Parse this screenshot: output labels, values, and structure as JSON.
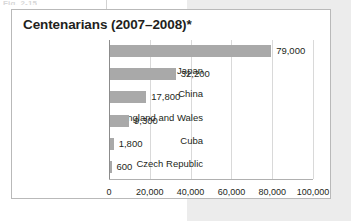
{
  "page": {
    "background_color": "#ffffff",
    "panel_color": "#ececec",
    "truncated_caption": "Fig. 2-15"
  },
  "figure": {
    "title": "Centenarians (2007–2008)*",
    "border_color": "#b9b9b9",
    "background_color": "#ffffff"
  },
  "chart_data": {
    "type": "bar",
    "orientation": "horizontal",
    "title": "Centenarians (2007–2008)*",
    "xlabel": "",
    "ylabel": "",
    "categories": [
      "U.S.",
      "Japan",
      "China",
      "England and Wales",
      "Cuba",
      "Czech Republic"
    ],
    "values": [
      79000,
      32200,
      17800,
      9300,
      1800,
      600
    ],
    "value_labels": [
      "79,000",
      "32,200",
      "17,800",
      "9,300",
      "1,800",
      "600"
    ],
    "xlim": [
      0,
      100000
    ],
    "xticks": [
      0,
      20000,
      40000,
      60000,
      80000,
      100000
    ],
    "xtick_labels": [
      "0",
      "20,000",
      "40,000",
      "60,000",
      "80,000",
      "100,000"
    ],
    "grid": true,
    "grid_axis": "x",
    "legend": false,
    "bar_color": "#a9a9a9",
    "gridline_color": "#d9d9d9",
    "axis_color": "#8c8c8c",
    "text_color": "#231f20"
  }
}
